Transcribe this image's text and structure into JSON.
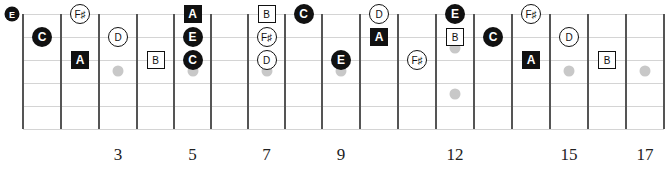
{
  "diagram": {
    "colors": {
      "string": "#d4d4d4",
      "fret": "#555555",
      "marker": "#c8c8c8",
      "note_dark": "#111111",
      "note_light": "#ffffff"
    },
    "geometry": {
      "fret_x": [
        23,
        61,
        99,
        137,
        174,
        211,
        248,
        285,
        322,
        360,
        398,
        436,
        474,
        512,
        550,
        588,
        626,
        664
      ],
      "string_y": [
        14,
        37,
        60,
        83,
        106,
        129
      ],
      "open_x": 12
    },
    "fret_numbers": [
      {
        "label": "3",
        "fret": 3
      },
      {
        "label": "5",
        "fret": 5
      },
      {
        "label": "7",
        "fret": 7
      },
      {
        "label": "9",
        "fret": 9
      },
      {
        "label": "12",
        "fret": 12
      },
      {
        "label": "15",
        "fret": 15
      },
      {
        "label": "17",
        "fret": 17
      }
    ],
    "inlay_markers": [
      {
        "fret": 3,
        "y": 71
      },
      {
        "fret": 5,
        "y": 71
      },
      {
        "fret": 7,
        "y": 71
      },
      {
        "fret": 9,
        "y": 71
      },
      {
        "fret": 12,
        "y": 48
      },
      {
        "fret": 12,
        "y": 94
      },
      {
        "fret": 15,
        "y": 71
      },
      {
        "fret": 17,
        "y": 71
      }
    ],
    "legend": {
      "C": "filled-circle",
      "E": "filled-circle",
      "D": "open-circle",
      "F♯": "open-circle",
      "A": "filled-square",
      "B": "open-square"
    },
    "notes": [
      {
        "label": "E",
        "string": 0,
        "fret": 0,
        "shape": "filled-circle",
        "small": true
      },
      {
        "label": "F♯",
        "string": 0,
        "fret": 2,
        "shape": "open-circle"
      },
      {
        "label": "A",
        "string": 0,
        "fret": 5,
        "shape": "filled-square"
      },
      {
        "label": "B",
        "string": 0,
        "fret": 7,
        "shape": "open-square"
      },
      {
        "label": "C",
        "string": 0,
        "fret": 8,
        "shape": "filled-circle"
      },
      {
        "label": "D",
        "string": 0,
        "fret": 10,
        "shape": "open-circle"
      },
      {
        "label": "E",
        "string": 0,
        "fret": 12,
        "shape": "filled-circle"
      },
      {
        "label": "F♯",
        "string": 0,
        "fret": 14,
        "shape": "open-circle"
      },
      {
        "label": "C",
        "string": 1,
        "fret": 1,
        "shape": "filled-circle"
      },
      {
        "label": "D",
        "string": 1,
        "fret": 3,
        "shape": "open-circle"
      },
      {
        "label": "E",
        "string": 1,
        "fret": 5,
        "shape": "filled-circle"
      },
      {
        "label": "F♯",
        "string": 1,
        "fret": 7,
        "shape": "open-circle"
      },
      {
        "label": "A",
        "string": 1,
        "fret": 10,
        "shape": "filled-square"
      },
      {
        "label": "B",
        "string": 1,
        "fret": 12,
        "shape": "open-square"
      },
      {
        "label": "C",
        "string": 1,
        "fret": 13,
        "shape": "filled-circle"
      },
      {
        "label": "D",
        "string": 1,
        "fret": 15,
        "shape": "open-circle"
      },
      {
        "label": "A",
        "string": 2,
        "fret": 2,
        "shape": "filled-square"
      },
      {
        "label": "B",
        "string": 2,
        "fret": 4,
        "shape": "open-square"
      },
      {
        "label": "C",
        "string": 2,
        "fret": 5,
        "shape": "filled-circle"
      },
      {
        "label": "D",
        "string": 2,
        "fret": 7,
        "shape": "open-circle"
      },
      {
        "label": "E",
        "string": 2,
        "fret": 9,
        "shape": "filled-circle"
      },
      {
        "label": "F♯",
        "string": 2,
        "fret": 11,
        "shape": "open-circle"
      },
      {
        "label": "A",
        "string": 2,
        "fret": 14,
        "shape": "filled-square"
      },
      {
        "label": "B",
        "string": 2,
        "fret": 16,
        "shape": "open-square"
      }
    ]
  }
}
